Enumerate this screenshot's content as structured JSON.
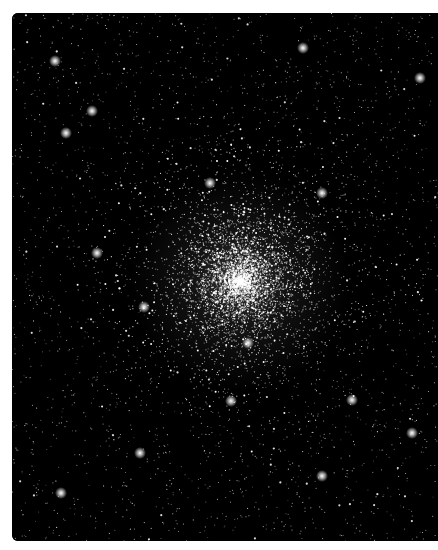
{
  "image": {
    "subject": "Globular star cluster",
    "description": "Black-and-white astronomical photograph of a dense globular star cluster against a black sky, densest at the center and thinning toward the edges, with a few bright foreground stars scattered around",
    "colors": {
      "page_background": "#ffffff",
      "sky": "#000000",
      "stars": "#ffffff"
    }
  }
}
